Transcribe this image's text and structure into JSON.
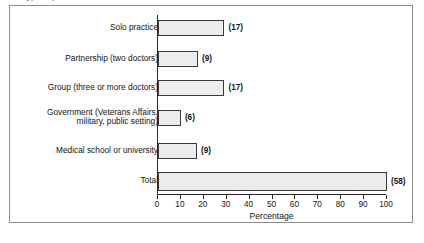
{
  "figure": {
    "clipped_caption_fragment": "Type of practice",
    "x_axis_title": "Percentage"
  },
  "chart_data": {
    "type": "bar",
    "orientation": "horizontal",
    "title": "",
    "xlabel": "Percentage",
    "ylabel": "",
    "xlim": [
      0,
      100
    ],
    "grid": false,
    "legend": null,
    "tick_labels": [
      "0",
      "10",
      "20",
      "30",
      "40",
      "50",
      "60",
      "70",
      "80",
      "90",
      "100"
    ],
    "tick_values": [
      0,
      10,
      20,
      30,
      40,
      50,
      60,
      70,
      80,
      90,
      100
    ],
    "categories": [
      "Solo practice",
      "Partnership (two doctors)",
      "Group (three or more doctors)",
      "Government (Veterans Affairs,\nmilitary, public setting)",
      "Medical school or university",
      "Total"
    ],
    "values": [
      29,
      17.5,
      29,
      10,
      17,
      100
    ],
    "data_labels": [
      "(17)",
      "(9)",
      "(17)",
      "(6)",
      "(9)",
      "(58)"
    ],
    "counts": [
      17,
      9,
      17,
      6,
      9,
      58
    ],
    "series": [
      {
        "name": "Percentage of respondents",
        "values": [
          29,
          17.5,
          29,
          10,
          17,
          100
        ]
      }
    ],
    "colors": {
      "bar_fill": "#ededed",
      "bar_border": "#3a3a3a",
      "axis": "#2b2b2b",
      "frame": "#8d8d8d",
      "text": "#141414"
    }
  },
  "rows": [
    {
      "label": "Solo practice",
      "value": 29,
      "data_label": "(17)"
    },
    {
      "label": "Partnership (two doctors)",
      "value": 17.5,
      "data_label": "(9)"
    },
    {
      "label": "Group (three or more doctors)",
      "value": 29,
      "data_label": "(17)"
    },
    {
      "label": "Government (Veterans Affairs,\nmilitary, public setting)",
      "value": 10,
      "data_label": "(6)"
    },
    {
      "label": "Medical school or university",
      "value": 17,
      "data_label": "(9)"
    },
    {
      "label": "Total",
      "value": 100,
      "data_label": "(58)"
    }
  ]
}
